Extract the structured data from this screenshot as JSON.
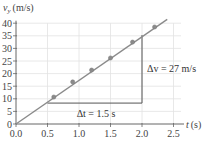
{
  "chart_data": {
    "type": "scatter",
    "title": "",
    "xlabel": "t (s)",
    "ylabel": "v_y (m/s)",
    "xlabel_main": "t",
    "xlabel_unit": "(s)",
    "ylabel_main": "v",
    "ylabel_sub": "y",
    "ylabel_unit": "(m/s)",
    "xlim": [
      0,
      2.6
    ],
    "ylim": [
      0,
      42
    ],
    "x_ticks": [
      0.0,
      0.5,
      1.0,
      1.5,
      2.0,
      2.5
    ],
    "x_tick_labels": [
      "0.0",
      "0.5",
      "1.0",
      "1.5",
      "2.0",
      "2.5"
    ],
    "y_ticks": [
      0,
      5,
      10,
      15,
      20,
      25,
      30,
      35,
      40
    ],
    "y_tick_labels": [
      "0",
      "5",
      "10",
      "15",
      "20",
      "25",
      "30",
      "35",
      "40"
    ],
    "grid": true,
    "series": [
      {
        "name": "measured data",
        "type": "scatter",
        "x": [
          0.6,
          0.9,
          1.2,
          1.5,
          1.85,
          2.2
        ],
        "y": [
          10.7,
          16.7,
          21.4,
          26.2,
          32.5,
          38.5
        ]
      },
      {
        "name": "best-fit line",
        "type": "line",
        "x": [
          0.0,
          2.4
        ],
        "y": [
          0.0,
          41.5
        ]
      }
    ],
    "annotations": [
      {
        "text": "Δt = 1.5 s",
        "label": "delta-t",
        "x_from": 0.5,
        "x_to": 2.0,
        "y": 8.3
      },
      {
        "text": "Δv = 27 m/s",
        "label": "delta-v",
        "x": 2.0,
        "y_from": 8.3,
        "y_to": 35.3
      }
    ],
    "colors": {
      "line": "#8a8a8a",
      "points": "#8a8a8a",
      "grid": "#e2e2e2",
      "axis": "#666666",
      "triangle": "#555555"
    }
  },
  "labels": {
    "delta_t": "Δt = 1.5 s",
    "delta_v": "Δv = 27 m/s"
  }
}
